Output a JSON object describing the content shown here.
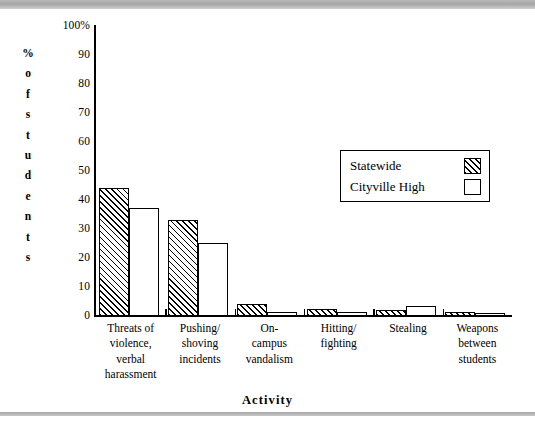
{
  "chart_data": {
    "type": "bar",
    "title": "",
    "xlabel": "Activity",
    "ylabel": "% of students",
    "ylim": [
      0,
      100
    ],
    "yticks": [
      "100%",
      "90",
      "80",
      "70",
      "60",
      "50",
      "40",
      "30",
      "20",
      "10",
      "0"
    ],
    "grid": false,
    "legend_position": "upper-right-inside",
    "categories": [
      "Threats of violence, verbal harassment",
      "Pushing/ shoving incidents",
      "On- campus vandalism",
      "Hitting/ fighting",
      "Stealing",
      "Weapons between students"
    ],
    "category_lines": [
      [
        "Threats of",
        "violence,",
        "verbal",
        "harassment"
      ],
      [
        "Pushing/",
        "shoving",
        "incidents"
      ],
      [
        "On-",
        "campus",
        "vandalism"
      ],
      [
        "Hitting/",
        "fighting"
      ],
      [
        "Stealing"
      ],
      [
        "Weapons",
        "between",
        "students"
      ]
    ],
    "series": [
      {
        "name": "Statewide",
        "pattern": "hatched",
        "values": [
          44,
          33,
          4,
          2.5,
          2,
          1.5
        ]
      },
      {
        "name": "Cityville High",
        "pattern": "open",
        "values": [
          37,
          25,
          1.5,
          1.5,
          3.5,
          0.5
        ]
      }
    ]
  },
  "legend": {
    "items": [
      {
        "label": "Statewide",
        "pattern": "hatched"
      },
      {
        "label": "Cityville High",
        "pattern": "open"
      }
    ]
  },
  "axes": {
    "y_title_letters": [
      "%",
      "o",
      "f",
      "s",
      "t",
      "u",
      "d",
      "e",
      "n",
      "t",
      "s"
    ],
    "x_title": "Activity"
  }
}
